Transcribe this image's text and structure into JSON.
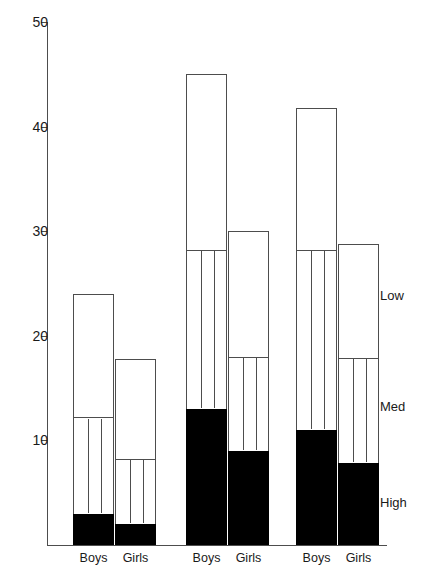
{
  "chart_data": {
    "type": "bar",
    "subtype": "stacked-vertical",
    "title": "",
    "xlabel": "",
    "ylabel": "",
    "ylim": [
      0,
      50
    ],
    "y_ticks": [
      0,
      10,
      20,
      30,
      40,
      50
    ],
    "y_tick_labels": [
      "",
      "10",
      "20",
      "30",
      "40",
      "50"
    ],
    "grid": false,
    "legend_position": "right-inside",
    "stack_order_bottom_to_top": [
      "High",
      "Med",
      "Low"
    ],
    "stack_colors": {
      "High": "#000000",
      "Med": "#ffffff",
      "Low": "#ffffff"
    },
    "groups": [
      "Group 1",
      "Group 2",
      "Group 3"
    ],
    "categories": [
      "Boys",
      "Girls"
    ],
    "legend": [
      {
        "label": "Low"
      },
      {
        "label": "Med"
      },
      {
        "label": "High"
      }
    ],
    "bars": [
      {
        "group": "Group 1",
        "category": "Boys",
        "total": 24.0,
        "high": 3.0,
        "med": 9.0,
        "low": 12.0,
        "high_top": 3.0,
        "med_top": 12.0
      },
      {
        "group": "Group 1",
        "category": "Girls",
        "total": 17.8,
        "high": 2.0,
        "med": 6.0,
        "low": 9.8,
        "high_top": 2.0,
        "med_top": 8.0
      },
      {
        "group": "Group 2",
        "category": "Boys",
        "total": 45.0,
        "high": 13.0,
        "med": 15.0,
        "low": 17.0,
        "high_top": 13.0,
        "med_top": 28.0
      },
      {
        "group": "Group 2",
        "category": "Girls",
        "total": 30.0,
        "high": 9.0,
        "med": 8.8,
        "low": 12.2,
        "high_top": 9.0,
        "med_top": 17.8
      },
      {
        "group": "Group 3",
        "category": "Boys",
        "total": 41.8,
        "high": 11.0,
        "med": 17.0,
        "low": 13.8,
        "high_top": 11.0,
        "med_top": 28.0
      },
      {
        "group": "Group 3",
        "category": "Girls",
        "total": 28.8,
        "high": 7.8,
        "med": 9.9,
        "low": 11.1,
        "high_top": 7.8,
        "med_top": 17.7
      }
    ]
  },
  "axis": {
    "ticks": [
      {
        "value": 50,
        "label": "50"
      },
      {
        "value": 40,
        "label": "40"
      },
      {
        "value": 30,
        "label": "30"
      },
      {
        "value": 20,
        "label": "20"
      },
      {
        "value": 10,
        "label": "10"
      }
    ]
  },
  "group_labels": [
    {
      "text": "Boys"
    },
    {
      "text": "Girls"
    },
    {
      "text": "Boys"
    },
    {
      "text": "Girls"
    },
    {
      "text": "Boys"
    },
    {
      "text": "Girls"
    }
  ],
  "legend_labels": [
    {
      "text": "Low"
    },
    {
      "text": "Med"
    },
    {
      "text": "High"
    }
  ]
}
